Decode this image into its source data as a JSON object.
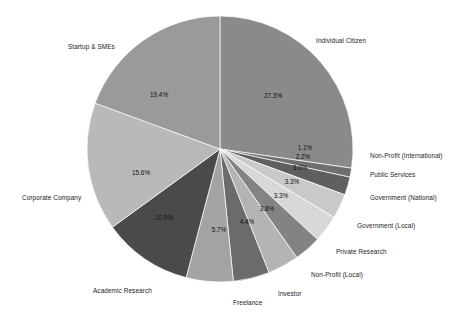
{
  "chart_data": {
    "type": "pie",
    "title": "",
    "subtitle": "",
    "xlabel": "",
    "ylabel": "",
    "legend_position": "none",
    "grid": false,
    "start_angle_deg": 90,
    "direction": "clockwise",
    "units": "percent",
    "total": 100.0,
    "categories": [
      "Individual Citizen",
      "Non-Profit (International)",
      "Public Services",
      "Government (National)",
      "Government (Local)",
      "Private Research",
      "Non-Profit (Local)",
      "Investor",
      "Freelance",
      "Academic Research",
      "Corporate Company",
      "Startup & SMEs"
    ],
    "values": [
      27.3,
      1.1,
      2.2,
      3.0,
      3.3,
      3.3,
      3.8,
      4.4,
      5.7,
      10.9,
      15.6,
      19.4
    ],
    "value_labels": [
      "27.3%",
      "1.1%",
      "2.2%",
      "3.0%",
      "3.3%",
      "3.3%",
      "3.8%",
      "4.4%",
      "5.7%",
      "10.9%",
      "15.6%",
      "19.4%"
    ],
    "colors": [
      "#8a8a8a",
      "#6f6f6f",
      "#5f5f5f",
      "#c9c9c9",
      "#d8d8d8",
      "#838383",
      "#b4b4b4",
      "#6b6b6b",
      "#a3a3a3",
      "#4a4a4a",
      "#b9b9b9",
      "#9a9a9a"
    ],
    "slices": [
      {
        "label": "Individual Citizen",
        "value": 27.3,
        "value_label": "27.3%",
        "color": "#8a8a8a"
      },
      {
        "label": "Non-Profit (International)",
        "value": 1.1,
        "value_label": "1.1%",
        "color": "#6f6f6f"
      },
      {
        "label": "Public Services",
        "value": 2.2,
        "value_label": "2.2%",
        "color": "#5f5f5f"
      },
      {
        "label": "Government (National)",
        "value": 3.0,
        "value_label": "3.0%",
        "color": "#c9c9c9"
      },
      {
        "label": "Government (Local)",
        "value": 3.3,
        "value_label": "3.3%",
        "color": "#d8d8d8"
      },
      {
        "label": "Private Research",
        "value": 3.3,
        "value_label": "3.3%",
        "color": "#838383"
      },
      {
        "label": "Non-Profit (Local)",
        "value": 3.8,
        "value_label": "3.8%",
        "color": "#b4b4b4"
      },
      {
        "label": "Investor",
        "value": 4.4,
        "value_label": "4.4%",
        "color": "#6b6b6b"
      },
      {
        "label": "Freelance",
        "value": 5.7,
        "value_label": "5.7%",
        "color": "#a3a3a3"
      },
      {
        "label": "Academic Research",
        "value": 10.9,
        "value_label": "10.9%",
        "color": "#4a4a4a"
      },
      {
        "label": "Corporate Company",
        "value": 15.6,
        "value_label": "15.6%",
        "color": "#b9b9b9"
      },
      {
        "label": "Startup & SMEs",
        "value": 19.4,
        "value_label": "19.4%",
        "color": "#9a9a9a"
      }
    ],
    "geometry": {
      "center_x": 220,
      "center_y": 149,
      "radius": 133
    },
    "label_positions": [
      {
        "label": "Individual Citizen",
        "x": 316,
        "y": 38,
        "align": "left"
      },
      {
        "label": "Non-Profit (International)",
        "x": 370,
        "y": 153,
        "align": "left"
      },
      {
        "label": "Public Services",
        "x": 370,
        "y": 172,
        "align": "left"
      },
      {
        "label": "Government (National)",
        "x": 370,
        "y": 195,
        "align": "left"
      },
      {
        "label": "Government (Local)",
        "x": 357,
        "y": 223,
        "align": "left"
      },
      {
        "label": "Private Research",
        "x": 336,
        "y": 249,
        "align": "left"
      },
      {
        "label": "Non-Profit (Local)",
        "x": 311,
        "y": 272,
        "align": "left"
      },
      {
        "label": "Investor",
        "x": 278,
        "y": 291,
        "align": "left"
      },
      {
        "label": "Freelance",
        "x": 233,
        "y": 300,
        "align": "left"
      },
      {
        "label": "Academic Research",
        "x": 93,
        "y": 288,
        "align": "left"
      },
      {
        "label": "Corporate Company",
        "x": 22,
        "y": 195,
        "align": "left"
      },
      {
        "label": "Startup & SMEs",
        "x": 68,
        "y": 44,
        "align": "left"
      }
    ],
    "value_label_positions": [
      {
        "value_label": "27.3%",
        "x": 273,
        "y": 96
      },
      {
        "value_label": "1.1%",
        "x": 305,
        "y": 148
      },
      {
        "value_label": "2.2%",
        "x": 303,
        "y": 157
      },
      {
        "value_label": "3.0%",
        "x": 300,
        "y": 168
      },
      {
        "value_label": "3.3%",
        "x": 292,
        "y": 182
      },
      {
        "value_label": "3.3%",
        "x": 281,
        "y": 196
      },
      {
        "value_label": "3.8%",
        "x": 267,
        "y": 209
      },
      {
        "value_label": "4.4%",
        "x": 247,
        "y": 222
      },
      {
        "value_label": "5.7%",
        "x": 219,
        "y": 230
      },
      {
        "value_label": "10.9%",
        "x": 164,
        "y": 218
      },
      {
        "value_label": "15.6%",
        "x": 141,
        "y": 173
      },
      {
        "value_label": "19.4%",
        "x": 159,
        "y": 95
      }
    ]
  }
}
